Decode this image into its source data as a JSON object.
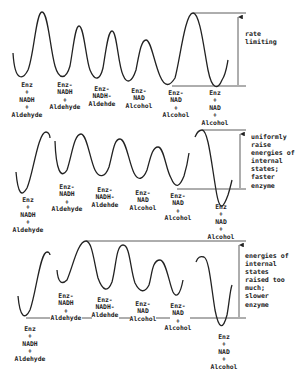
{
  "diagram": {
    "panels": [
      {
        "id": "baseline",
        "annotation": "rate\nlimiting",
        "states": [
          "Enz\n+\nNADH\n+\nAldehyde",
          "Enz-\nNADH\n+\nAldehyde",
          "Enz-\nNADH-\nAldehde",
          "Enz-\nNAD\nAlcohol",
          "Enz-\nNAD\n+\nAlcohol",
          "Enz\n+\nNAD\n+\nAlcohol"
        ]
      },
      {
        "id": "uniform-raise",
        "annotation": "uniformly\nraise\nenergies of\ninternal\nstates;\nfaster\nenzyme",
        "states": [
          "Enz\n+\nNADH\n+\nAldehyde",
          "Enz-\nNADH\n+\nAldehyde",
          "Enz-\nNADH-\nAldehde",
          "Enz-\nNAD\nAlcohol",
          "Enz-\nNAD\n+\nAlcohol",
          "Enz\n+\nNAD\n+\nAlcohol"
        ]
      },
      {
        "id": "over-raise",
        "annotation": "energies of\ninternal\nstates\nraised too\nmuch;\nslower\nenzyme",
        "states": [
          "Enz\n+\nNADH\n+\nAldehyde",
          "Enz-\nNADH\n+\nAldehyde",
          "Enz-\nNADH-\nAldehde",
          "Enz-\nNAD\nAlcohol",
          "Enz-\nNAD\n+\nAlcohol",
          "Enz\n+\nNAD\n+\nAlcohol"
        ]
      }
    ]
  }
}
